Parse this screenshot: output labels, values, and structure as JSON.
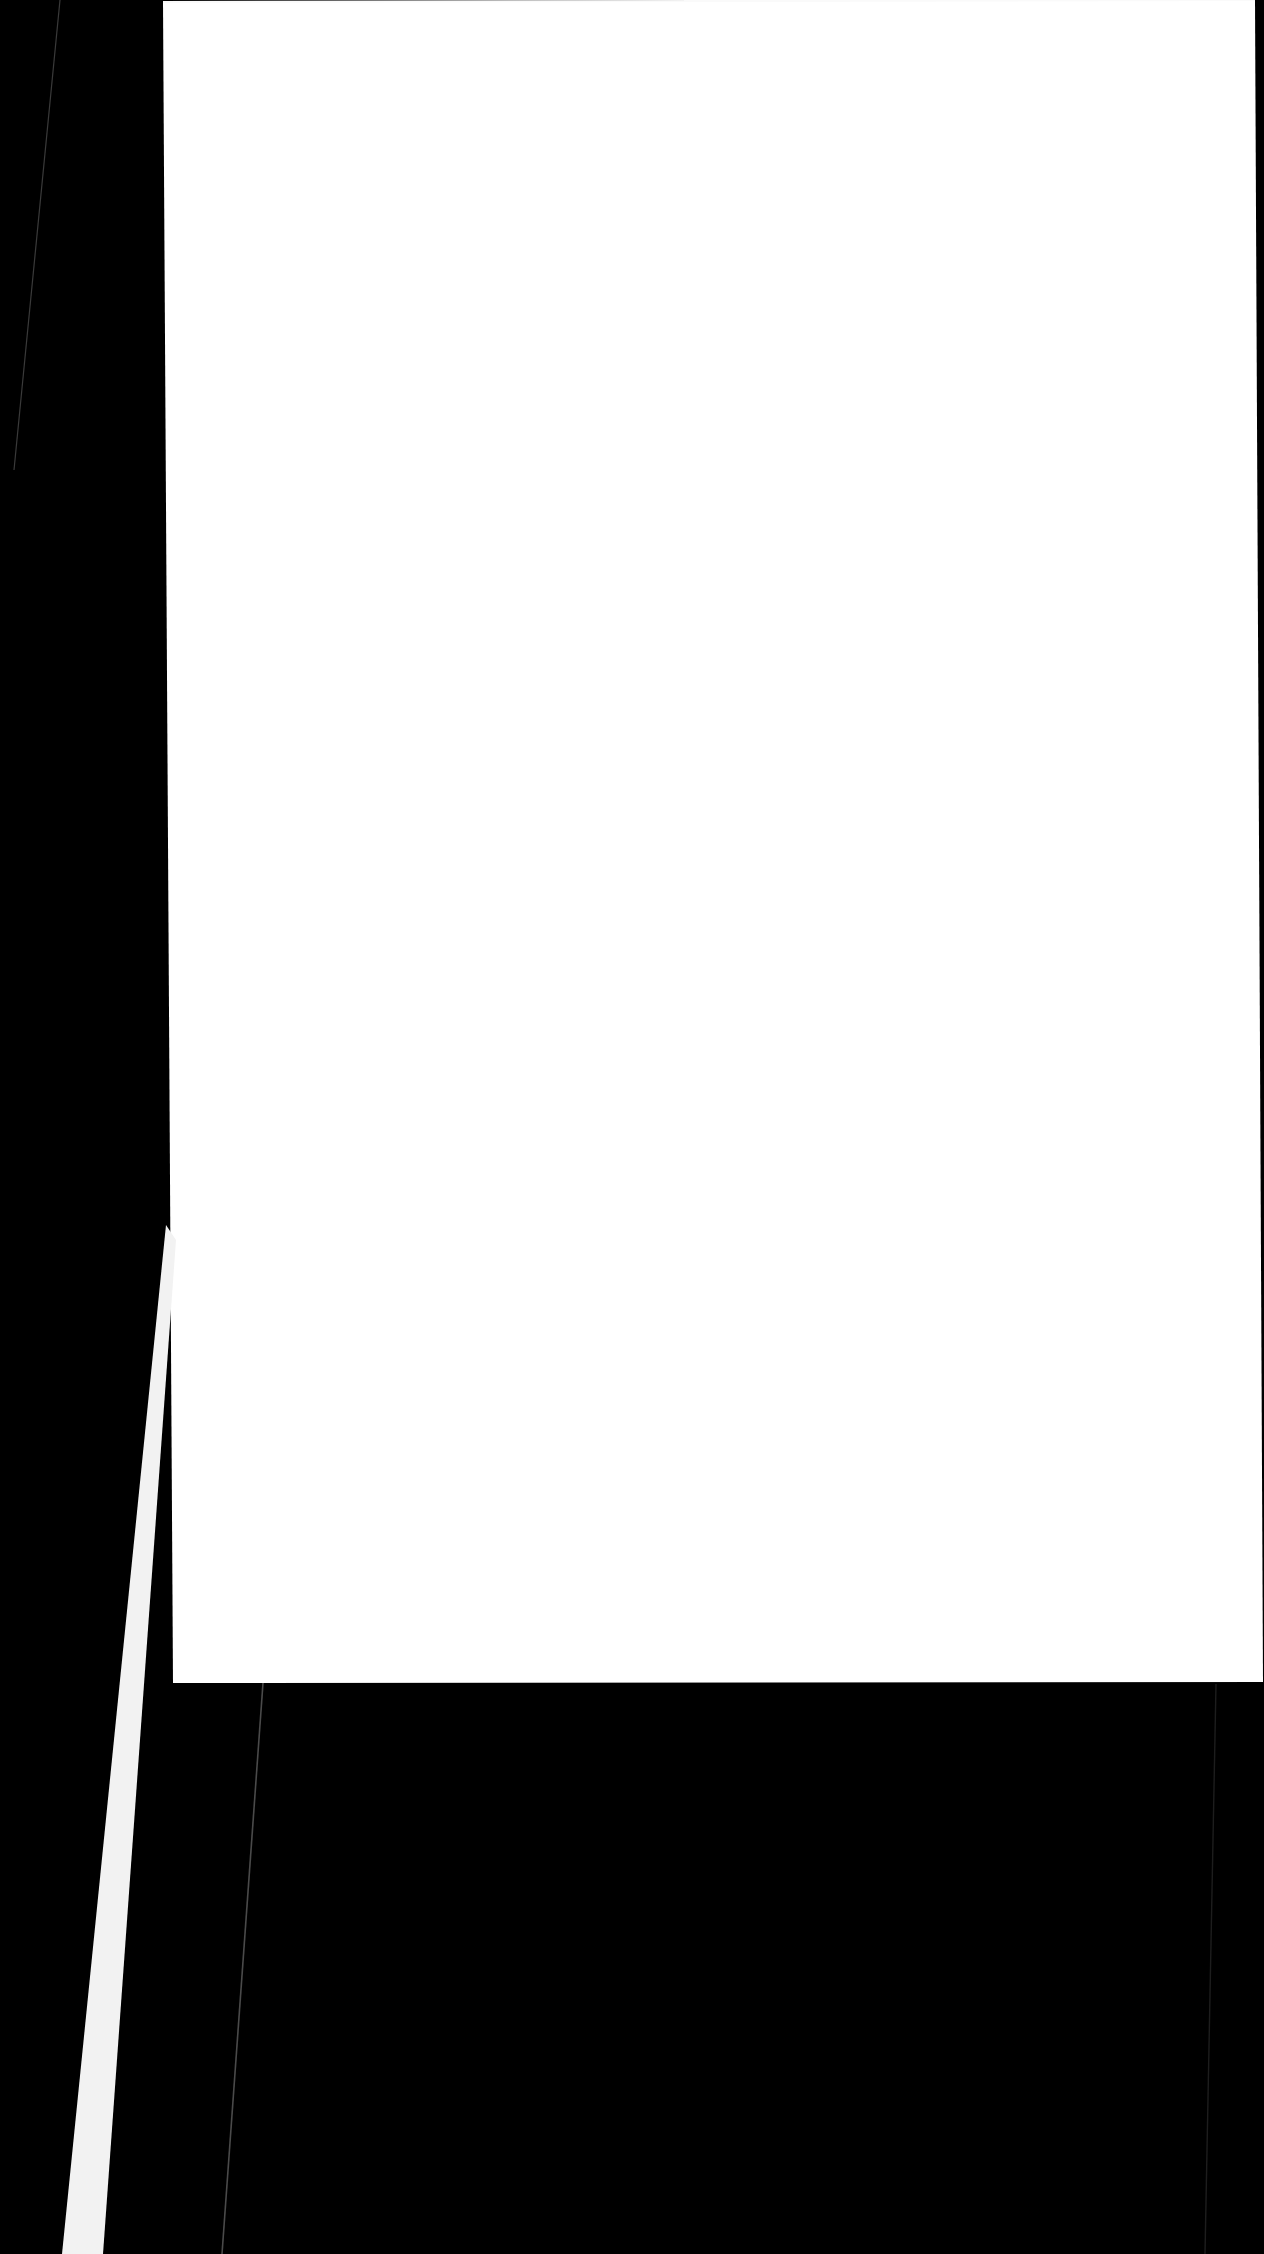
{
  "scene": {
    "name": "photographed-blank-page",
    "width": 1264,
    "height": 2254,
    "background_color": "#000000"
  },
  "backdrop": {
    "label": "dark-surface",
    "color": "#000000",
    "hairline_color": "#3a3a3a",
    "streak_color": "#f2f2f2",
    "shadow_line_color": "#4a4a4a"
  },
  "page": {
    "label": "document-sheet",
    "paper_color": "#ffffff",
    "edge_color": "#fafafa",
    "corners": {
      "top_left": "163, 2",
      "top_right": "1255, 0",
      "bottom_right": "1263, 1682",
      "bottom_left": "173, 1683"
    },
    "content_text": ""
  },
  "overlays": {
    "top_hairline_label": "backdrop-hairline",
    "lower_streak_label": "paper-edge-streak",
    "under_page_line_label": "table-seam-line"
  }
}
